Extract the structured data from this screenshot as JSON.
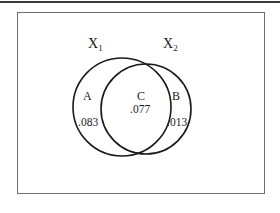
{
  "diagram": {
    "type": "venn",
    "sets": [
      {
        "id": "X1",
        "label": "X",
        "subscript": "1"
      },
      {
        "id": "X2",
        "label": "X",
        "subscript": "2"
      }
    ],
    "regions": [
      {
        "id": "A",
        "label": "A",
        "value": ".083",
        "description": "X1 only"
      },
      {
        "id": "C",
        "label": "C",
        "value": ".077",
        "description": "X1 and X2"
      },
      {
        "id": "B",
        "label": "B",
        "value": ".013",
        "description": "X2 only"
      }
    ],
    "colors": {
      "stroke": "#1a1a1a",
      "frame": "#6e6e6e",
      "rule": "#3a3a3a",
      "background": "#ffffff"
    }
  }
}
